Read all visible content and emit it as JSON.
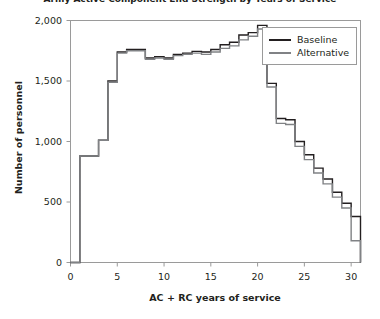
{
  "chart_data": {
    "type": "line",
    "subtype": "step",
    "title": "Army Active Component End Strength by Years of Service",
    "xlabel": "AC + RC years of service",
    "ylabel": "Number of personnel",
    "xlim": [
      0,
      31
    ],
    "ylim": [
      0,
      2000
    ],
    "xticks": [
      0,
      5,
      10,
      15,
      20,
      25,
      30
    ],
    "xtick_labels": [
      "0",
      "5",
      "10",
      "15",
      "20",
      "25",
      "30"
    ],
    "yticks": [
      0,
      500,
      1000,
      1500,
      2000
    ],
    "ytick_labels": [
      "0",
      "500",
      "1,000",
      "1,500",
      "2,000"
    ],
    "grid": false,
    "legend_position": "top-right",
    "x": [
      0,
      1,
      2,
      3,
      4,
      5,
      6,
      7,
      8,
      9,
      10,
      11,
      12,
      13,
      14,
      15,
      16,
      17,
      18,
      19,
      20,
      21,
      22,
      23,
      24,
      25,
      26,
      27,
      28,
      29,
      30
    ],
    "series": [
      {
        "name": "Baseline",
        "color": "#231f20",
        "values": [
          0,
          880,
          880,
          1010,
          1500,
          1740,
          1760,
          1760,
          1690,
          1700,
          1690,
          1720,
          1730,
          1745,
          1740,
          1760,
          1800,
          1820,
          1880,
          1900,
          1960,
          1480,
          1190,
          1180,
          1000,
          890,
          780,
          690,
          580,
          490,
          380
        ]
      },
      {
        "name": "Alternative",
        "color": "#808285",
        "values": [
          0,
          880,
          880,
          1010,
          1490,
          1730,
          1750,
          1750,
          1680,
          1690,
          1680,
          1710,
          1720,
          1730,
          1720,
          1740,
          1770,
          1790,
          1840,
          1870,
          1930,
          1450,
          1150,
          1140,
          960,
          850,
          740,
          650,
          540,
          450,
          180
        ]
      }
    ]
  },
  "legend": {
    "entries": [
      {
        "label": "Baseline"
      },
      {
        "label": "Alternative"
      }
    ]
  }
}
